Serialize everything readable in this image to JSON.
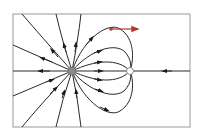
{
  "diagram": {
    "type": "electric-field-lines",
    "frame": {
      "x": 13,
      "y": 14,
      "width": 177,
      "height": 113,
      "stroke": "#9a9a9a"
    },
    "charges": [
      {
        "id": "source",
        "x": 72,
        "y": 71,
        "r": 4,
        "fill": "#8a8a8a"
      },
      {
        "id": "sink",
        "x": 130,
        "y": 71,
        "r": 3.5,
        "fill": "#ffffff",
        "stroke": "#8a8a8a"
      }
    ],
    "particle": {
      "x": 111,
      "y": 29,
      "fill": "#b03a2e"
    },
    "velocity_arrow": {
      "x1": 111,
      "y1": 29,
      "x2": 140,
      "y2": 29,
      "color": "#b03a2e"
    },
    "line_color": "#2a2a2a"
  }
}
